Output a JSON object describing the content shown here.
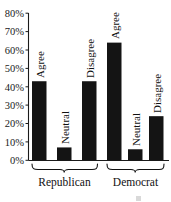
{
  "chart_data": {
    "type": "bar",
    "title": "",
    "subtitle": "",
    "xlabel": "",
    "ylabel": "",
    "ylim": [
      0,
      80
    ],
    "y_unit": "%",
    "grid": false,
    "legend_position": "none",
    "groups": [
      "Republican",
      "Democrat"
    ],
    "categories": [
      "Agree",
      "Neutral",
      "Disagree"
    ],
    "series": [
      {
        "name": "Republican",
        "values": [
          43,
          7,
          43
        ]
      },
      {
        "name": "Democrat",
        "values": [
          64,
          6,
          24
        ]
      }
    ],
    "y_ticks": [
      0,
      10,
      20,
      30,
      40,
      50,
      60,
      70,
      80
    ],
    "y_tick_labels": [
      "0%",
      "10%",
      "20%",
      "30%",
      "40%",
      "50%",
      "60%",
      "70%",
      "80%"
    ],
    "bar_labels": [
      [
        "Agree",
        "Neutral",
        "Disagree"
      ],
      [
        "Agree",
        "Neutral",
        "Disagree"
      ]
    ]
  },
  "axis": {
    "ticks": [
      {
        "label": "80%",
        "value": 80
      },
      {
        "label": "70%",
        "value": 70
      },
      {
        "label": "60%",
        "value": 60
      },
      {
        "label": "50%",
        "value": 50
      },
      {
        "label": "40%",
        "value": 40
      },
      {
        "label": "30%",
        "value": 30
      },
      {
        "label": "20%",
        "value": 20
      },
      {
        "label": "10%",
        "value": 10
      },
      {
        "label": "0%",
        "value": 0
      }
    ]
  },
  "groups": [
    {
      "label": "Republican"
    },
    {
      "label": "Democrat"
    }
  ],
  "bars": [
    {
      "group": "Republican",
      "label": "Agree",
      "value": 43
    },
    {
      "group": "Republican",
      "label": "Neutral",
      "value": 7
    },
    {
      "group": "Republican",
      "label": "Disagree",
      "value": 43
    },
    {
      "group": "Democrat",
      "label": "Agree",
      "value": 64
    },
    {
      "group": "Democrat",
      "label": "Neutral",
      "value": 6
    },
    {
      "group": "Democrat",
      "label": "Disagree",
      "value": 24
    }
  ],
  "colors": {
    "bar_fill": "#141414",
    "axis": "#1a1a1a",
    "text": "#111111",
    "background": "#ffffff"
  }
}
